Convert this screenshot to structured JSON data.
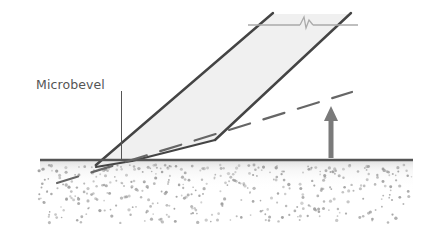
{
  "diagram": {
    "labels": {
      "microbevel": "Microbevel"
    },
    "colors": {
      "line": "#444444",
      "blade_fill": "#f0f0f0",
      "arrow": "#7a7a7a",
      "dash": "#666666",
      "speckle": "#9a9a9a",
      "break_line": "#aaaaaa"
    },
    "elements": [
      "blade-with-bevel",
      "microbevel-at-tip",
      "work-surface",
      "textured-material-below-surface",
      "dashed-clearance-line",
      "raise-arrow",
      "break-line-top"
    ]
  }
}
